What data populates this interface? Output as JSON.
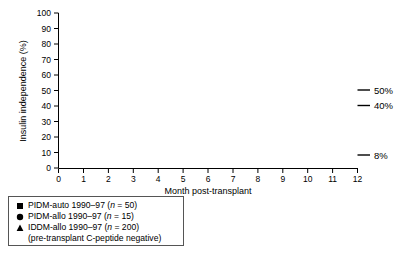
{
  "chart_data": {
    "type": "line",
    "title": "",
    "xlabel": "Month post-transplant",
    "ylabel": "Insulin independence (%)",
    "xlim": [
      0,
      12
    ],
    "ylim": [
      0,
      100
    ],
    "xticks": [
      "0",
      "1",
      "2",
      "3",
      "4",
      "5",
      "6",
      "7",
      "8",
      "9",
      "10",
      "11",
      "12"
    ],
    "yticks": [
      "0",
      "10",
      "20",
      "30",
      "40",
      "50",
      "60",
      "70",
      "80",
      "90",
      "100"
    ],
    "grid": false,
    "legend_position": "below-left",
    "step_style": "post",
    "x": [
      0,
      0.5,
      1,
      1.5,
      2,
      2.5,
      3,
      3.5,
      4,
      4.5,
      5,
      5.5,
      6,
      6.5,
      7,
      7.5,
      8,
      8.5,
      9,
      9.5,
      10,
      10.5,
      11,
      11.5,
      12
    ],
    "series": [
      {
        "name": "PIDM-auto 1990-97 (n = 50)",
        "marker": "square",
        "color": "#000000",
        "end_label": "50%",
        "values": [
          0,
          0,
          68,
          68,
          68,
          68,
          68,
          68,
          68,
          68,
          66,
          66,
          64,
          64,
          60,
          60,
          58.5,
          58.5,
          53.5,
          53.5,
          50.5,
          50.5,
          50.5,
          50.5,
          50.5
        ],
        "marker_points": [
          {
            "x": 0,
            "y": 0
          },
          {
            "x": 1,
            "y": 68
          },
          {
            "x": 2,
            "y": 68
          },
          {
            "x": 3,
            "y": 68
          },
          {
            "x": 4,
            "y": 68
          },
          {
            "x": 5,
            "y": 66
          },
          {
            "x": 6,
            "y": 64
          },
          {
            "x": 7,
            "y": 60
          },
          {
            "x": 8,
            "y": 58.5
          },
          {
            "x": 9,
            "y": 53.5
          },
          {
            "x": 10,
            "y": 50.5
          },
          {
            "x": 11,
            "y": 50.5
          },
          {
            "x": 12,
            "y": 50.5
          }
        ]
      },
      {
        "name": "PIDM-allo 1990-97 (n = 15)",
        "marker": "circle",
        "color": "#000000",
        "end_label": "40%",
        "values": [
          0,
          0,
          32.5,
          32.5,
          46.5,
          46.5,
          53.5,
          53.5,
          53.5,
          53.5,
          53.5,
          53.5,
          53.5,
          53.5,
          46.5,
          46.5,
          46.5,
          46.5,
          46.5,
          46.5,
          47,
          47,
          40.5,
          40.5,
          40.5
        ],
        "marker_points": [
          {
            "x": 0,
            "y": 0
          },
          {
            "x": 1,
            "y": 32.5
          },
          {
            "x": 2,
            "y": 46.5
          },
          {
            "x": 3,
            "y": 53.5
          },
          {
            "x": 4,
            "y": 53.5
          },
          {
            "x": 5,
            "y": 53.5
          },
          {
            "x": 6,
            "y": 53.5
          },
          {
            "x": 7,
            "y": 46.5
          },
          {
            "x": 8,
            "y": 46.5
          },
          {
            "x": 9,
            "y": 46.5
          },
          {
            "x": 10,
            "y": 47
          },
          {
            "x": 11,
            "y": 40.5
          },
          {
            "x": 12,
            "y": 40.5
          }
        ]
      },
      {
        "name": "IDDM-allo 1990-97 (n = 200)",
        "marker": "triangle",
        "color": "#000000",
        "end_label": "8%",
        "values": [
          0,
          0,
          1,
          1.5,
          2,
          2,
          3.5,
          3.5,
          3.5,
          2,
          2,
          4,
          4,
          5,
          5,
          5,
          5,
          6.5,
          6.5,
          8,
          8,
          9.5,
          9.5,
          8.5,
          8.5
        ],
        "marker_points": [
          {
            "x": 0,
            "y": 0
          },
          {
            "x": 1,
            "y": 1
          },
          {
            "x": 2,
            "y": 2
          },
          {
            "x": 3,
            "y": 3.5
          },
          {
            "x": 4,
            "y": 3.5
          },
          {
            "x": 5,
            "y": 2
          },
          {
            "x": 6,
            "y": 4
          },
          {
            "x": 7,
            "y": 5
          },
          {
            "x": 8,
            "y": 5
          },
          {
            "x": 9,
            "y": 6.5
          },
          {
            "x": 10,
            "y": 8
          },
          {
            "x": 11,
            "y": 9.5
          },
          {
            "x": 12,
            "y": 8.5
          }
        ]
      }
    ],
    "annotations": [
      {
        "text": "50%",
        "series": "PIDM-auto"
      },
      {
        "text": "40%",
        "series": "PIDM-allo"
      },
      {
        "text": "8%",
        "series": "IDDM-allo"
      }
    ]
  },
  "axes": {
    "ylabel": "Insulin independence (%)",
    "xlabel": "Month post-transplant",
    "yticks": [
      "100",
      "90",
      "80",
      "70",
      "60",
      "50",
      "40",
      "30",
      "20",
      "10",
      "0"
    ],
    "xticks": [
      "0",
      "1",
      "2",
      "3",
      "4",
      "5",
      "6",
      "7",
      "8",
      "9",
      "10",
      "11",
      "12"
    ]
  },
  "end_labels": {
    "auto": "50%",
    "allo": "40%",
    "iddm": "8%"
  },
  "legend": {
    "items": [
      {
        "marker": "square",
        "prefix": "PIDM-auto 1990–97 (",
        "italic": "n",
        "suffix": " = 50)"
      },
      {
        "marker": "circle",
        "prefix": "PIDM-allo 1990–97 (",
        "italic": "n",
        "suffix": " = 15)"
      },
      {
        "marker": "triangle",
        "prefix": "IDDM-allo 1990–97 (",
        "italic": "n",
        "suffix": " = 200)"
      }
    ],
    "subnote": "(pre-transplant C-peptide negative)"
  }
}
